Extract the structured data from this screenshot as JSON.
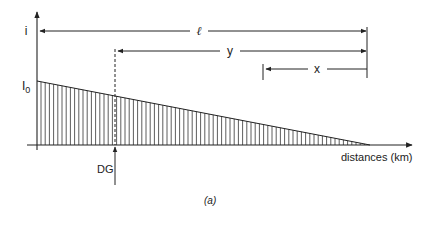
{
  "diagram": {
    "y_axis_label": "i",
    "initial_current_label": "I",
    "initial_current_sub": "0",
    "x_axis_label": "distances (km)",
    "generator_label": "DG",
    "caption": "(a)",
    "dimensions": [
      {
        "name": "total-length",
        "label": "ℓ"
      },
      {
        "name": "dg-distance",
        "label": "y"
      },
      {
        "name": "point-distance",
        "label": "x"
      }
    ]
  },
  "colors": {
    "line": "#222222",
    "background": "#ffffff"
  }
}
